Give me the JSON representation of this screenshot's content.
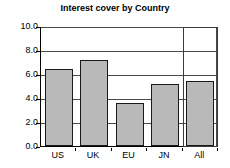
{
  "chart_data": {
    "type": "bar",
    "title": "Interest cover by Country",
    "xlabel": "",
    "ylabel": "",
    "categories": [
      "US",
      "UK",
      "EU",
      "JN",
      "All"
    ],
    "values": [
      6.4,
      7.2,
      3.6,
      5.15,
      5.45
    ],
    "ylim": [
      0.0,
      10.0
    ],
    "ytick_labels": [
      "10.0",
      "8.0",
      "6.0",
      "4.0",
      "2.0",
      "0.0"
    ],
    "ytick_values": [
      10.0,
      8.0,
      6.0,
      4.0,
      2.0,
      0.0
    ],
    "grid": true,
    "legend": false,
    "legend_position": "none",
    "highlight_category": "All",
    "colors": {
      "bar_fill": "#b9b9b9",
      "bar_border": "#1a1a1a",
      "gridline": "#4a4a4a",
      "axis": "#000000",
      "highlight_border": "#3a3a3a",
      "background": "#ffffff",
      "text": "#000000"
    }
  }
}
